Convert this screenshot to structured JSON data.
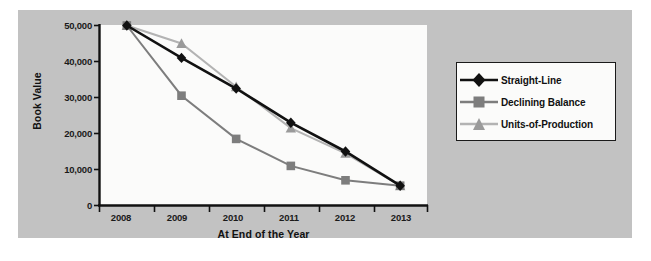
{
  "chart_data": {
    "type": "line",
    "title": "",
    "xlabel": "At End of the Year",
    "ylabel": "Book Value",
    "categories": [
      "2008",
      "2009",
      "2010",
      "2011",
      "2012",
      "2013"
    ],
    "ylim": [
      0,
      50000
    ],
    "yticks": [
      0,
      10000,
      20000,
      30000,
      40000,
      50000
    ],
    "ytick_labels": [
      "0",
      "10,000",
      "20,000",
      "30,000",
      "40,000",
      "50,000"
    ],
    "grid": false,
    "legend_position": "right",
    "series": [
      {
        "name": "Straight-Line",
        "marker": "diamond",
        "color": "#111111",
        "values": [
          50000,
          41000,
          32500,
          23000,
          15000,
          5500
        ]
      },
      {
        "name": "Declining Balance",
        "marker": "square",
        "color": "#7d7d7d",
        "values": [
          50000,
          30500,
          18500,
          11000,
          7000,
          5500
        ]
      },
      {
        "name": "Units-of-Production",
        "marker": "triangle",
        "color": "#b3b3b3",
        "values": [
          50000,
          45000,
          33000,
          21500,
          14500,
          5500
        ]
      }
    ]
  },
  "axes": {
    "ytick_labels": [
      "50,000",
      "40,000",
      "30,000",
      "20,000",
      "10,000",
      "0"
    ],
    "xtick_labels": [
      "2008",
      "2009",
      "2010",
      "2011",
      "2012",
      "2013"
    ],
    "yaxis_title": "Book Value",
    "xaxis_title": "At End of the Year"
  },
  "legend": {
    "items": [
      {
        "label": "Straight-Line",
        "marker": "diamond-marker",
        "color": "#111111"
      },
      {
        "label": "Declining Balance",
        "marker": "square-marker",
        "color": "#7d7d7d"
      },
      {
        "label": "Units-of-Production",
        "marker": "triangle-marker",
        "color": "#b3b3b3"
      }
    ]
  },
  "colors": {
    "panel_background": "#c2c2c2",
    "plot_background": "#fbfbfa",
    "axis": "#111111",
    "series_straight_line": "#111111",
    "series_declining_balance": "#7d7d7d",
    "series_units_of_production": "#b3b3b3"
  }
}
